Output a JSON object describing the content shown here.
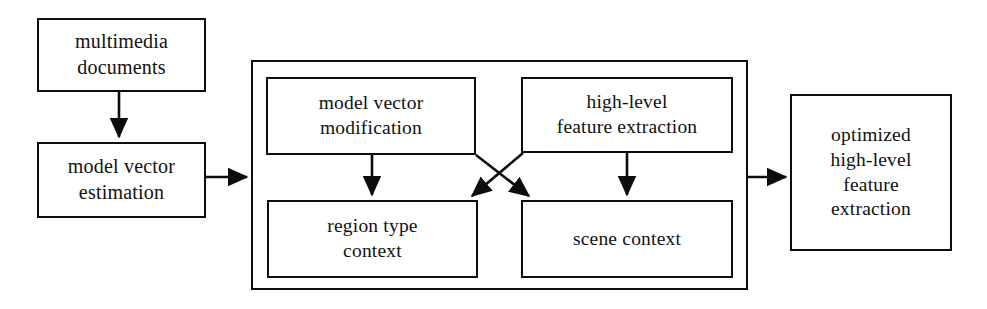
{
  "diagram": {
    "stroke_color": "#0d0d0d",
    "background_color": "#ffffff",
    "nodes": [
      {
        "id": "multimedia-documents",
        "lines": [
          "multimedia",
          "documents"
        ]
      },
      {
        "id": "model-vector-estimation",
        "lines": [
          "model vector",
          "estimation"
        ]
      },
      {
        "id": "model-vector-modification",
        "lines": [
          "model vector",
          "modification"
        ]
      },
      {
        "id": "region-type-context",
        "lines": [
          "region type",
          "context"
        ]
      },
      {
        "id": "high-level-feature-extraction",
        "lines": [
          "high-level",
          "feature extraction"
        ]
      },
      {
        "id": "scene-context",
        "lines": [
          "scene context"
        ]
      },
      {
        "id": "optimized-high-level-feature-extraction",
        "lines": [
          "optimized",
          "high-level",
          "feature",
          "extraction"
        ]
      }
    ],
    "group": {
      "id": "context-container",
      "label": ""
    },
    "edges": [
      {
        "from": "multimedia-documents",
        "to": "model-vector-estimation",
        "style": "arrow-down"
      },
      {
        "from": "model-vector-estimation",
        "to": "context-container",
        "style": "arrow-right"
      },
      {
        "from": "model-vector-modification",
        "to": "region-type-context",
        "style": "arrow-down"
      },
      {
        "from": "high-level-feature-extraction",
        "to": "scene-context",
        "style": "arrow-down"
      },
      {
        "from": "model-vector-modification",
        "to": "scene-context",
        "style": "arrow-diagonal-cross"
      },
      {
        "from": "high-level-feature-extraction",
        "to": "region-type-context",
        "style": "arrow-diagonal-cross"
      },
      {
        "from": "context-container",
        "to": "optimized-high-level-feature-extraction",
        "style": "arrow-right"
      }
    ]
  }
}
